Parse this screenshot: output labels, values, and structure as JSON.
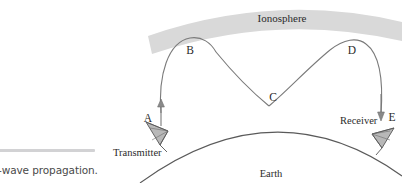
{
  "caption": {
    "text": "-wave propagation."
  },
  "figure": {
    "ionosphere_label": "Ionosphere",
    "earth_label": "Earth",
    "transmitter_label": "Transmitter",
    "receiver_label": "Receiver",
    "points": [
      {
        "id": "A",
        "label": "A",
        "x": 155,
        "y": 120,
        "desc": "upward ray leaving transmitter"
      },
      {
        "id": "B",
        "label": "B",
        "x": 190,
        "y": 51,
        "desc": "first ionospheric refraction"
      },
      {
        "id": "C",
        "label": "C",
        "x": 273,
        "y": 98,
        "desc": "ground reflection point"
      },
      {
        "id": "D",
        "label": "D",
        "x": 352,
        "y": 51,
        "desc": "second ionospheric refraction"
      },
      {
        "id": "E",
        "label": "E",
        "x": 392,
        "y": 118,
        "desc": "downward ray entering receiver"
      }
    ],
    "colors": {
      "ionosphere_band": "#d8d8d8",
      "ray": "#6e6e6e",
      "earth": "#555555",
      "antenna_fill": "#b7b7b7",
      "antenna_stroke": "#555555",
      "caption_rule": "#d2d2d4",
      "text": "#2b2b2b"
    }
  }
}
